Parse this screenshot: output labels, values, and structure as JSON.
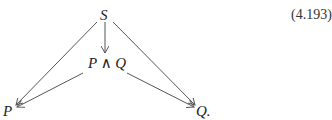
{
  "diagram": {
    "nodes": {
      "S": "S",
      "P_and_Q": "P ∧ Q",
      "P": "P",
      "Q": "Q."
    },
    "edges": [
      {
        "from": "S",
        "to": "P"
      },
      {
        "from": "S",
        "to": "P ∧ Q"
      },
      {
        "from": "S",
        "to": "Q"
      },
      {
        "from": "P ∧ Q",
        "to": "P"
      },
      {
        "from": "P ∧ Q",
        "to": "Q"
      }
    ],
    "line_color": "#555555"
  },
  "equation_number": "(4.193)"
}
